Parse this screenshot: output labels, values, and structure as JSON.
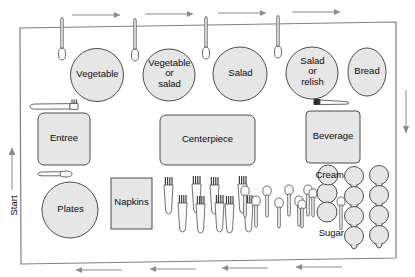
{
  "diagram": {
    "colors": {
      "shape_fill": "#e6e6e6",
      "shape_stroke": "#4d4d4d",
      "frame_stroke": "#808080",
      "arrow_stroke": "#8a8a8a",
      "utensil_stroke": "#5a5a5a",
      "text": "#0a0a0a",
      "background": "#ffffff"
    },
    "flow": {
      "start_label": "Start",
      "top_arrow_direction": "right",
      "top_arrow_count": 4,
      "bottom_arrow_direction": "left",
      "bottom_arrow_count": 4,
      "left_arrow_direction": "up",
      "right_arrow_direction": "down"
    },
    "dishes": [
      {
        "name": "dish-vegetable",
        "label": "Vegetable",
        "shape": "circle"
      },
      {
        "name": "dish-vegetable-or-salad",
        "label": "Vegetable\nor\nsalad",
        "shape": "circle"
      },
      {
        "name": "dish-salad",
        "label": "Salad",
        "shape": "circle"
      },
      {
        "name": "dish-salad-or-relish",
        "label": "Salad\nor\nrelish",
        "shape": "circle"
      },
      {
        "name": "dish-bread",
        "label": "Bread",
        "shape": "ellipse"
      }
    ],
    "trays": [
      {
        "name": "tray-entree",
        "label": "Entree"
      },
      {
        "name": "tray-centerpiece",
        "label": "Centerpiece"
      },
      {
        "name": "tray-beverage",
        "label": "Beverage"
      }
    ],
    "stacks": [
      {
        "name": "stack-plates",
        "label": "Plates",
        "shape": "circle"
      },
      {
        "name": "stack-napkins",
        "label": "Napkins",
        "shape": "rect"
      }
    ],
    "condiments": [
      {
        "name": "bowl-cream",
        "label": "Cream"
      },
      {
        "name": "bowl-sugar",
        "label": "Sugar"
      }
    ],
    "utensils": {
      "serving_spoons_top": 4,
      "forks_back_row": 4,
      "forks_front_row": 5,
      "spoons_back_row": 4,
      "spoons_front_row": 3,
      "condiment_spoons": 3,
      "fork_and_knife_near_entree": 1,
      "knife_near_beverage": 1
    },
    "cups": {
      "columns": 2,
      "rows": 4,
      "total": 8
    },
    "bowls": {
      "count": 3
    }
  }
}
